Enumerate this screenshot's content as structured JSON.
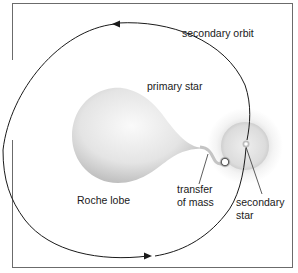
{
  "diagram": {
    "type": "binary-star-mass-transfer",
    "labels": {
      "secondary_orbit": "secondary orbit",
      "primary_star": "primary star",
      "roche_lobe": "Roche lobe",
      "transfer_line1": "transfer",
      "transfer_line2": "of mass",
      "secondary_line1": "secondary",
      "secondary_line2": "star"
    },
    "colors": {
      "frame": "#6b6b6b",
      "orbit": "#1a1a1a",
      "star_light": "#f7f7f7",
      "star_dark": "#bdbdbd"
    }
  }
}
